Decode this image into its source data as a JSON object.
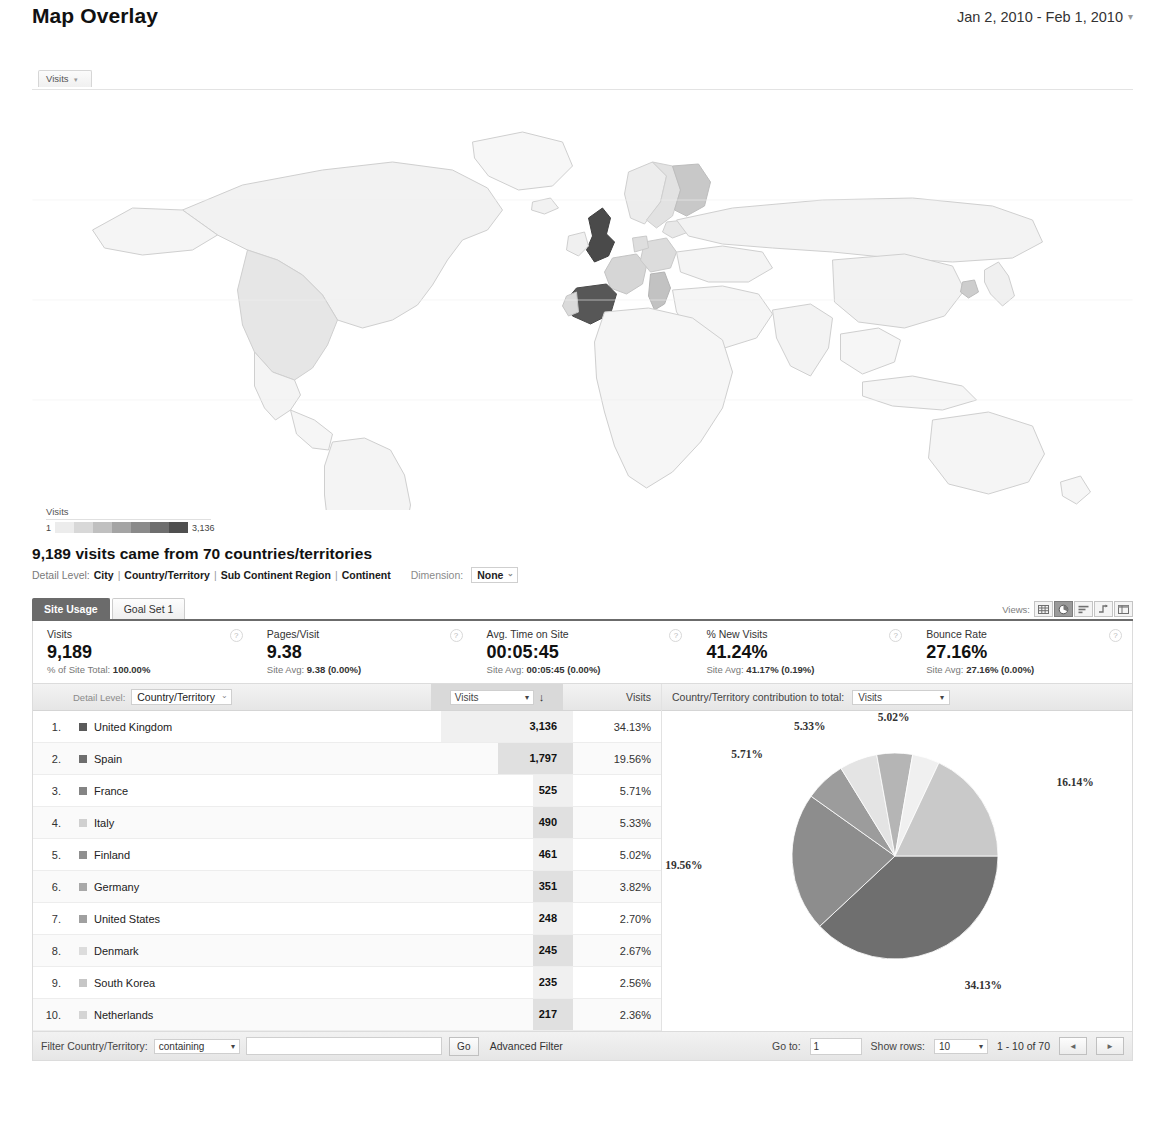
{
  "header": {
    "title": "Map Overlay",
    "date_range": "Jan 2, 2010 - Feb 1, 2010",
    "date_caret": "▾"
  },
  "map": {
    "metric_tab_label": "Visits",
    "metric_tab_caret": "▾",
    "legend": {
      "title": "Visits",
      "min": "1",
      "max": "3,136",
      "swatches": [
        "#ececec",
        "#d8d8d8",
        "#c0c0c0",
        "#a4a4a4",
        "#8a8a8a",
        "#6e6e6e",
        "#4f4f4f"
      ]
    }
  },
  "summary": {
    "headline": "9,189 visits came from 70 countries/territories",
    "detail_label": "Detail Level:",
    "detail_levels": [
      "City",
      "Country/Territory",
      "Sub Continent Region",
      "Continent"
    ],
    "dimension_label": "Dimension:",
    "dimension_value": "None",
    "dimension_caret": "⌄"
  },
  "report": {
    "tabs": [
      {
        "label": "Site Usage",
        "active": true
      },
      {
        "label": "Goal Set 1",
        "active": false
      }
    ],
    "views_label": "Views:",
    "view_icons": [
      "table-view-icon",
      "pie-view-icon",
      "bar-view-icon",
      "comparison-view-icon",
      "pivot-view-icon"
    ],
    "selected_view_index": 1,
    "metrics": [
      {
        "name": "Visits",
        "value": "9,189",
        "sub_prefix": "% of Site Total:",
        "sub_value": "100.00%"
      },
      {
        "name": "Pages/Visit",
        "value": "9.38",
        "sub_prefix": "Site Avg:",
        "sub_value": "9.38 (0.00%)"
      },
      {
        "name": "Avg. Time on Site",
        "value": "00:05:45",
        "sub_prefix": "Site Avg:",
        "sub_value": "00:05:45 (0.00%)"
      },
      {
        "name": "% New Visits",
        "value": "41.24%",
        "sub_prefix": "Site Avg:",
        "sub_value": "41.17% (0.19%)"
      },
      {
        "name": "Bounce Rate",
        "value": "27.16%",
        "sub_prefix": "Site Avg:",
        "sub_value": "27.16% (0.00%)"
      }
    ],
    "help_icon": "?"
  },
  "table": {
    "detail_level_label": "Detail Level:",
    "dimension_picker_value": "Country/Territory",
    "dimension_picker_caret": "⌄",
    "metric_picker_value": "Visits",
    "metric_picker_caret": "▾",
    "sort_arrow": "↓",
    "pct_header": "Visits",
    "contribution_label": "Country/Territory contribution to total:",
    "contribution_value": "Visits",
    "contribution_caret": "▾",
    "rows": [
      {
        "index": "1.",
        "country": "United Kingdom",
        "visits": "3,136",
        "pct": "34.13%",
        "swatch": "#5a5a5a",
        "bar": 100
      },
      {
        "index": "2.",
        "country": "Spain",
        "visits": "1,797",
        "pct": "19.56%",
        "swatch": "#6e6e6e",
        "bar": 57
      },
      {
        "index": "3.",
        "country": "France",
        "visits": "525",
        "pct": "5.71%",
        "swatch": "#848484",
        "bar": 17
      },
      {
        "index": "4.",
        "country": "Italy",
        "visits": "490",
        "pct": "5.33%",
        "swatch": "#d0d0d0",
        "bar": 16
      },
      {
        "index": "5.",
        "country": "Finland",
        "visits": "461",
        "pct": "5.02%",
        "swatch": "#8f8f8f",
        "bar": 15
      },
      {
        "index": "6.",
        "country": "Germany",
        "visits": "351",
        "pct": "3.82%",
        "swatch": "#a8a8a8",
        "bar": 11
      },
      {
        "index": "7.",
        "country": "United States",
        "visits": "248",
        "pct": "2.70%",
        "swatch": "#a0a0a0",
        "bar": 8
      },
      {
        "index": "8.",
        "country": "Denmark",
        "visits": "245",
        "pct": "2.67%",
        "swatch": "#dcdcdc",
        "bar": 8
      },
      {
        "index": "9.",
        "country": "South Korea",
        "visits": "235",
        "pct": "2.56%",
        "swatch": "#c6c6c6",
        "bar": 7
      },
      {
        "index": "10.",
        "country": "Netherlands",
        "visits": "217",
        "pct": "2.36%",
        "swatch": "#d4d4d4",
        "bar": 7
      }
    ]
  },
  "footer": {
    "filter_label": "Filter Country/Territory:",
    "filter_operator": "containing",
    "filter_caret": "▾",
    "filter_value": "",
    "filter_placeholder": "",
    "go_label": "Go",
    "advanced_filter": "Advanced Filter",
    "goto_label": "Go to:",
    "goto_value": "1",
    "show_rows_label": "Show rows:",
    "show_rows_value": "10",
    "show_rows_caret": "▾",
    "range_text": "1 - 10 of 70",
    "prev_glyph": "◄",
    "next_glyph": "►"
  },
  "chart_data": {
    "type": "pie",
    "title": "Country/Territory contribution to total: Visits",
    "categories": [
      "United Kingdom",
      "Spain",
      "France",
      "Italy",
      "Finland",
      "Germany",
      "Other"
    ],
    "values": [
      34.13,
      19.56,
      5.71,
      5.33,
      5.02,
      3.82,
      16.14
    ],
    "labels": [
      "34.13%",
      "19.56%",
      "5.71%",
      "5.33%",
      "5.02%",
      "3.82%",
      "16.14%"
    ],
    "visible_labels": [
      "34.13%",
      "19.56%",
      "5.71%",
      "5.33%",
      "5.02%",
      "16.14%"
    ],
    "colors": [
      "#6f6f6f",
      "#8d8d8d",
      "#9c9c9c",
      "#e4e4e4",
      "#b5b5b5",
      "#f0f0f0",
      "#c9c9c9"
    ],
    "unit": "percent",
    "legend": "none"
  }
}
